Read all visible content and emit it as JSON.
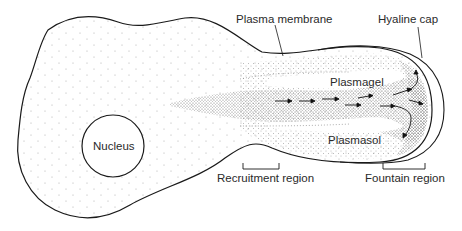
{
  "diagram": {
    "labels": {
      "nucleus": "Nucleus",
      "plasma_membrane": "Plasma membrane",
      "hyaline_cap": "Hyaline cap",
      "plasmagel": "Plasmagel",
      "plasmasol": "Plasmasol",
      "recruitment_region": "Recruitment region",
      "fountain_region": "Fountain region"
    },
    "colors": {
      "outline": "#1a1a1a",
      "stipple": "#7a7a7a",
      "background": "#ffffff"
    },
    "flow_arrows": 10
  }
}
